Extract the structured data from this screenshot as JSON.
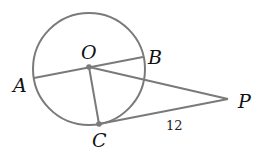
{
  "diagram": {
    "type": "circle-tangent-geometry",
    "points": {
      "O": {
        "label": "O",
        "role": "center"
      },
      "A": {
        "label": "A",
        "role": "on-circle"
      },
      "B": {
        "label": "B",
        "role": "on-circle"
      },
      "C": {
        "label": "C",
        "role": "point-of-tangency"
      },
      "P": {
        "label": "P",
        "role": "external-point"
      }
    },
    "segments": [
      {
        "from": "A",
        "to": "B",
        "name": "diameter"
      },
      {
        "from": "O",
        "to": "C",
        "name": "radius"
      },
      {
        "from": "O",
        "to": "P",
        "name": "secant-to-external"
      },
      {
        "from": "C",
        "to": "P",
        "name": "tangent",
        "length_label": "12"
      }
    ],
    "labels": {
      "O": "O",
      "A": "A",
      "B": "B",
      "C": "C",
      "P": "P",
      "CP_length": "12"
    },
    "colors": {
      "stroke": "#7a7a7a",
      "text": "#111111",
      "background": "#ffffff"
    }
  }
}
